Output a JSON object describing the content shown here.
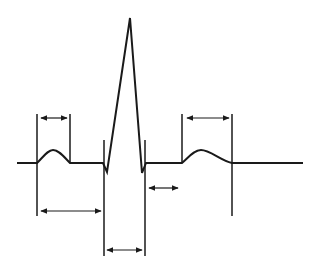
{
  "diagram": {
    "title": "",
    "type": "ecg-waveform-intervals",
    "colors": {
      "background": "#ffffff",
      "stroke": "#1a1a1a"
    },
    "baseline_y": 163,
    "waveform": {
      "segments": [
        {
          "name": "baseline-pre",
          "from_x": 17,
          "to_x": 37
        },
        {
          "name": "p-wave",
          "from_x": 37,
          "to_x": 70,
          "peak_y": 150
        },
        {
          "name": "pr-segment",
          "from_x": 70,
          "to_x": 103
        },
        {
          "name": "qrs-complex",
          "q_x": 107,
          "q_y": 172,
          "r_x": 130,
          "r_y": 18,
          "s_x": 142,
          "s_y": 173,
          "end_x": 146
        },
        {
          "name": "st-segment",
          "from_x": 146,
          "to_x": 182
        },
        {
          "name": "t-wave",
          "from_x": 182,
          "to_x": 232,
          "peak_y": 150
        },
        {
          "name": "baseline-post",
          "from_x": 232,
          "to_x": 303
        }
      ]
    },
    "interval_markers": [
      {
        "name": "p-wave-duration",
        "left_x": 37,
        "right_x": 70,
        "arrow_y": 118
      },
      {
        "name": "pr-interval",
        "left_x": 37,
        "right_x": 104,
        "arrow_y": 211
      },
      {
        "name": "qrs-duration",
        "left_x": 104,
        "right_x": 145,
        "arrow_y": 250
      },
      {
        "name": "st-segment",
        "left_x": 145,
        "right_x": 182,
        "arrow_y": 188
      },
      {
        "name": "t-wave-duration",
        "left_x": 182,
        "right_x": 232,
        "arrow_y": 118
      }
    ],
    "labels": []
  }
}
